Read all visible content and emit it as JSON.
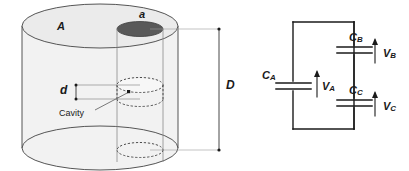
{
  "figure": {
    "colors": {
      "outline": "#4d4d4d",
      "body_fill": "#f2f2f2",
      "top_face_fill": "#ebebeb",
      "hole_fill": "#595959",
      "wire": "#1a1a1a",
      "dimension_line": "#4d4d4d",
      "background": "#ffffff"
    }
  },
  "cylinder": {
    "area_label": "A",
    "hole_label": "a",
    "gap_label": "d",
    "cavity_label": "Cavity",
    "height_label": "D"
  },
  "circuit": {
    "capacitors": [
      {
        "name": "C",
        "sub": "A"
      },
      {
        "name": "C",
        "sub": "B"
      },
      {
        "name": "C",
        "sub": "C"
      }
    ],
    "voltages": [
      {
        "name": "V",
        "sub": "A"
      },
      {
        "name": "V",
        "sub": "B"
      },
      {
        "name": "V",
        "sub": "C"
      }
    ],
    "labels": {
      "CA": "C",
      "CA_sub": "A",
      "CB": "C",
      "CB_sub": "B",
      "CC": "C",
      "CC_sub": "C",
      "VA": "V",
      "VA_sub": "A",
      "VB": "V",
      "VB_sub": "B",
      "VC": "V",
      "VC_sub": "C"
    }
  }
}
